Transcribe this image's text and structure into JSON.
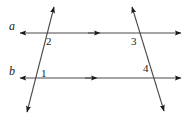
{
  "figure": {
    "type": "geometry-diagram",
    "width": 191,
    "height": 115,
    "background_color": "#ffffff",
    "stroke_color": "#4a4a4a",
    "arrow_color": "#1a1a1a",
    "label_color": "#1a1a1a"
  },
  "lines": {
    "parallel_lines": [
      {
        "name": "a",
        "label": "a",
        "label_x": 9,
        "label_y": 20,
        "y": 33,
        "x_start": 20,
        "x_end": 181,
        "mid_arrow_x": 98,
        "arrow_left": true,
        "arrow_right": true,
        "mid_arrow": true
      },
      {
        "name": "b",
        "label": "b",
        "label_x": 9,
        "label_y": 65,
        "y": 78,
        "x_start": 20,
        "x_end": 181,
        "mid_arrow_x": 95,
        "arrow_left": true,
        "arrow_right": true,
        "mid_arrow": true
      }
    ],
    "transversals": [
      {
        "name": "left-transversal",
        "x1": 27,
        "y1": 112,
        "x2": 54,
        "y2": 7,
        "arrow_start": true,
        "arrow_end": true
      },
      {
        "name": "right-transversal",
        "x1": 132,
        "y1": 7,
        "x2": 164,
        "y2": 111,
        "arrow_start": true,
        "arrow_end": true
      }
    ]
  },
  "angle_labels": [
    {
      "name": "angle-1",
      "text": "1",
      "x": 41,
      "y": 68
    },
    {
      "name": "angle-2",
      "text": "2",
      "x": 46,
      "y": 36
    },
    {
      "name": "angle-3",
      "text": "3",
      "x": 131,
      "y": 36
    },
    {
      "name": "angle-4",
      "text": "4",
      "x": 143,
      "y": 63
    }
  ]
}
